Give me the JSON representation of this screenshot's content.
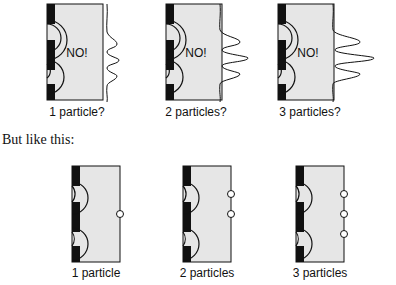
{
  "top_row": {
    "panels": [
      {
        "label": "1 particle?",
        "overlay": "NO!",
        "wave": "interference",
        "peak_scale": 1
      },
      {
        "label": "2 particles?",
        "overlay": "NO!",
        "wave": "interference",
        "peak_scale": 2
      },
      {
        "label": "3 particles?",
        "overlay": "NO!",
        "wave": "interference",
        "peak_scale": 3
      }
    ]
  },
  "transition_text": "But like this:",
  "bottom_row": {
    "panels": [
      {
        "label": "1 particle",
        "particles": 1
      },
      {
        "label": "2 particles",
        "particles": 2
      },
      {
        "label": "3 particles",
        "particles": 3
      }
    ]
  },
  "colors": {
    "barrier": "#111111",
    "screen_fill": "#e6e6e6",
    "stroke": "#111111",
    "particle_fill": "#ffffff"
  }
}
